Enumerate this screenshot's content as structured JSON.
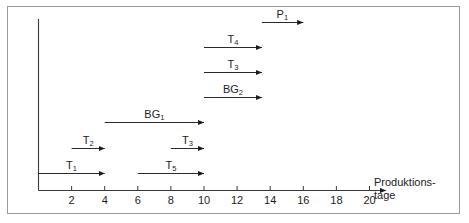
{
  "figure": {
    "axis_title_line1": "Produktions-",
    "axis_title_line2": "tage"
  },
  "chart_data": {
    "type": "bar",
    "title": "",
    "xlabel": "Produktionstage",
    "ylabel": "",
    "xlim": [
      0,
      21
    ],
    "grid": false,
    "legend": null,
    "orientation": "horizontal",
    "xtick_labels": [
      "2",
      "4",
      "6",
      "8",
      "10",
      "12",
      "14",
      "16",
      "18",
      "20"
    ],
    "xtick_values": [
      2,
      4,
      6,
      8,
      10,
      12,
      14,
      16,
      18,
      20
    ],
    "bars": [
      {
        "label": "P",
        "sub": "1",
        "start": 13.5,
        "end": 16.0,
        "row": 0
      },
      {
        "label": "T",
        "sub": "4",
        "start": 10.0,
        "end": 13.5,
        "row": 1
      },
      {
        "label": "T",
        "sub": "3",
        "start": 10.0,
        "end": 13.5,
        "row": 2
      },
      {
        "label": "BG",
        "sub": "2",
        "start": 10.0,
        "end": 13.5,
        "row": 3
      },
      {
        "label": "BG",
        "sub": "1",
        "start": 4.0,
        "end": 10.0,
        "row": 4
      },
      {
        "label": "T",
        "sub": "2",
        "start": 2.0,
        "end": 4.0,
        "row": 5
      },
      {
        "label": "T",
        "sub": "3",
        "start": 8.0,
        "end": 10.0,
        "row": 5
      },
      {
        "label": "T",
        "sub": "1",
        "start": 0.0,
        "end": 4.0,
        "row": 6
      },
      {
        "label": "T",
        "sub": "5",
        "start": 6.0,
        "end": 10.0,
        "row": 6
      }
    ]
  }
}
